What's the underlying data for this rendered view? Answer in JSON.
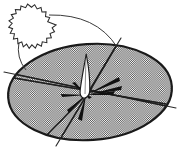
{
  "figure": {
    "title": "Hatched ellipse with radiating chords, central flame form and serrated circle",
    "caption": "",
    "canvas": {
      "width": 180,
      "height": 153,
      "background": "#ffffff"
    },
    "colors": {
      "outline": "#1a1a1a",
      "hatch_dark": "#4d4d4d",
      "hatch_light": "#ffffff",
      "fill_gray": "#9e9e9e",
      "thin_line": "#2b2b2b",
      "flame_fill": "#ffffff",
      "spike_fill": "#111111"
    },
    "elements": [
      {
        "name": "main-ellipse",
        "kind": "ellipse",
        "cx": 90,
        "cy": 92,
        "rx": 82,
        "ry": 48,
        "rotation": -4,
        "fill": "checkerboard-hatch",
        "stroke": "#1a1a1a",
        "stroke_width": 2.2
      },
      {
        "name": "serrated-circle",
        "kind": "zigzag-circle",
        "cx": 37,
        "cy": 25,
        "radius": 19,
        "teeth": 26,
        "tooth_depth": 3.2,
        "fill": "#ffffff",
        "stroke": "#2b2b2b",
        "stroke_width": 1.1
      },
      {
        "name": "flame-leaf",
        "kind": "tapered-leaf",
        "apex_x": 86,
        "apex_y": 55,
        "base_x": 84,
        "base_y": 97,
        "half_width": 5.5,
        "fill": "#ffffff",
        "stroke": "#1b1b1b",
        "stroke_width": 1.2
      }
    ],
    "chords": [
      {
        "name": "chord-upper-right-to-lower-left",
        "x1": 121,
        "y1": 38,
        "x2": 56,
        "y2": 146
      },
      {
        "name": "chord-left-to-right",
        "x1": 4,
        "y1": 72,
        "x2": 176,
        "y2": 108
      },
      {
        "name": "chord-left-to-center-right",
        "x1": 14,
        "y1": 78,
        "x2": 166,
        "y2": 104
      },
      {
        "name": "chord-center-to-bottom-left",
        "x1": 86,
        "y1": 95,
        "x2": 41,
        "y2": 141
      },
      {
        "name": "chord-center-to-top-right",
        "x1": 88,
        "y1": 94,
        "x2": 119,
        "y2": 41
      }
    ],
    "connector_curves": [
      {
        "name": "connector-arc-upper",
        "from_x": 49,
        "from_y": 15,
        "to_x": 117,
        "to_y": 47,
        "ctrl_x": 96,
        "ctrl_y": 14
      },
      {
        "name": "connector-arc-lower-left",
        "from_x": 19,
        "from_y": 42,
        "to_x": 26,
        "to_y": 70,
        "ctrl_x": 16,
        "ctrl_y": 58
      }
    ],
    "spikes": [
      {
        "name": "spike-east-upper",
        "tip_x": 119,
        "tip_y": 79,
        "width": 4.0
      },
      {
        "name": "spike-east",
        "tip_x": 121,
        "tip_y": 88,
        "width": 3.4
      },
      {
        "name": "spike-east-lower",
        "tip_x": 114,
        "tip_y": 93,
        "width": 3.0
      },
      {
        "name": "spike-south",
        "tip_x": 80,
        "tip_y": 120,
        "width": 4.2
      },
      {
        "name": "spike-south-west",
        "tip_x": 70,
        "tip_y": 112,
        "width": 3.0
      },
      {
        "name": "spike-west",
        "tip_x": 62,
        "tip_y": 95,
        "width": 3.2
      },
      {
        "name": "spike-north-west",
        "tip_x": 73,
        "tip_y": 84,
        "width": 2.6
      },
      {
        "name": "spike-hub",
        "tip_x": 90,
        "tip_y": 96,
        "width": 2.2
      }
    ],
    "spike_origin": {
      "x": 86,
      "y": 95
    }
  }
}
